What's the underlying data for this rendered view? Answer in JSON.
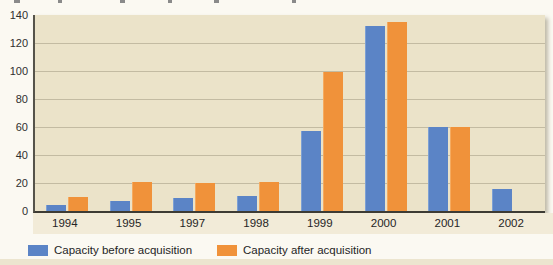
{
  "chart_data": {
    "type": "bar",
    "title": "",
    "xlabel": "",
    "ylabel": "",
    "categories": [
      "1994",
      "1995",
      "1997",
      "1998",
      "1999",
      "2000",
      "2001",
      "2002"
    ],
    "series": [
      {
        "name": "Capacity before acquisition",
        "color": "#5b84c6",
        "values": [
          4,
          7,
          9,
          11,
          57,
          132,
          60,
          16
        ]
      },
      {
        "name": "Capacity after acquisition",
        "color": "#f0923a",
        "values": [
          10,
          21,
          20,
          21,
          99,
          135,
          60,
          null
        ]
      }
    ],
    "ylim": [
      0,
      140
    ],
    "yticks": [
      0,
      20,
      40,
      60,
      80,
      100,
      120,
      140
    ],
    "grid": true,
    "legend_position": "bottom",
    "colors": {
      "plot_background": "#ebe3c9",
      "gridline": "#c3bba2",
      "axis": "#3d3b34",
      "page_background": "#fbf9f2",
      "label_text": "#252525"
    }
  }
}
